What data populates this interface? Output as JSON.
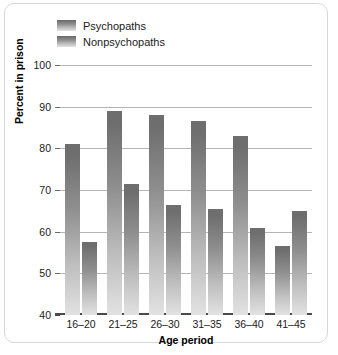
{
  "chart_data": {
    "type": "bar",
    "title": "",
    "xlabel": "Age period",
    "ylabel": "Percent in prison",
    "categories": [
      "16–20",
      "21–25",
      "26–30",
      "31–35",
      "36–40",
      "41–45"
    ],
    "series": [
      {
        "name": "Psychopaths",
        "values": [
          81,
          89,
          88,
          86.5,
          83,
          56.5
        ]
      },
      {
        "name": "Nonpsychopaths",
        "values": [
          57.5,
          71.5,
          66.5,
          65.5,
          61,
          65
        ]
      }
    ],
    "ylim": [
      40,
      100
    ],
    "yticks": [
      40,
      50,
      60,
      70,
      80,
      90,
      100
    ],
    "ytick_labels": [
      "40",
      "50",
      "60",
      "70",
      "80",
      "90",
      "100"
    ],
    "grid": true,
    "legend_position": "top-left",
    "colors": {
      "bar_gradient_top": "#6e6e6e",
      "bar_gradient_bottom": "#e2e2e2",
      "gridline": "#b5b5b5",
      "axis": "#4a4a4a",
      "text": "#1a1a1a",
      "frame_border": "#d8d8d8",
      "background": "#ffffff"
    }
  }
}
